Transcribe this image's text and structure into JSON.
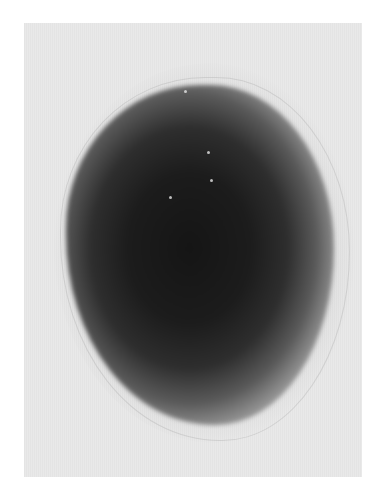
{
  "image": {
    "description": "Grayscale micrograph of a dark, roughly round blob with soft diffuse edges on a light gray background",
    "colors": {
      "background": "#ffffff",
      "panel": "#e9e9e9",
      "blob_core": "#151515"
    },
    "specks": [
      {
        "x": 160,
        "y": 67
      },
      {
        "x": 183,
        "y": 128
      },
      {
        "x": 186,
        "y": 156
      },
      {
        "x": 145,
        "y": 173
      },
      {
        "x": 235,
        "y": 78
      }
    ]
  }
}
